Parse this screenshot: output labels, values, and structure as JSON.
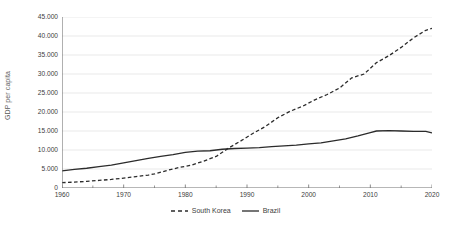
{
  "chart_data": {
    "type": "line",
    "title": "",
    "subtitle": "",
    "xlabel": "",
    "ylabel": "GDP per capita",
    "xlim": [
      1960,
      2020
    ],
    "ylim": [
      0,
      45000
    ],
    "grid": "horizontal",
    "legend_position": "bottom-center",
    "y_tick_labels": [
      "45.000",
      "40.000",
      "35.000",
      "30.000",
      "25.000",
      "20.000",
      "15.000",
      "10.000",
      "5.000",
      "0"
    ],
    "y_tick_values": [
      45000,
      40000,
      35000,
      30000,
      25000,
      20000,
      15000,
      10000,
      5000,
      0
    ],
    "x_tick_labels": [
      "1960",
      "1970",
      "1980",
      "1990",
      "2000",
      "2010",
      "2020"
    ],
    "x_tick_values": [
      1960,
      1970,
      1980,
      1990,
      2000,
      2010,
      2020
    ],
    "x_minor_tick_values": [
      1965,
      1975,
      1985,
      1995,
      2005,
      2015
    ],
    "series": [
      {
        "name": "South Korea",
        "style": "dashed",
        "color": "#2b2b2b",
        "x": [
          1960,
          1962,
          1964,
          1966,
          1968,
          1970,
          1972,
          1974,
          1975,
          1977,
          1979,
          1981,
          1983,
          1985,
          1987,
          1989,
          1991,
          1993,
          1995,
          1997,
          1999,
          2001,
          2003,
          2005,
          2007,
          2009,
          2011,
          2013,
          2015,
          2017,
          2019,
          2020
        ],
        "values": [
          1400,
          1550,
          1750,
          2000,
          2250,
          2600,
          3000,
          3400,
          3700,
          4600,
          5400,
          6000,
          7100,
          8300,
          10500,
          12400,
          14400,
          16200,
          18500,
          20200,
          21500,
          23200,
          24600,
          26300,
          29000,
          30000,
          33000,
          34800,
          37000,
          39500,
          41500,
          42000
        ],
        "start_value": 1400,
        "end_value": 42000
      },
      {
        "name": "Brazil",
        "style": "solid",
        "color": "#2b2b2b",
        "x": [
          1960,
          1962,
          1964,
          1966,
          1968,
          1970,
          1972,
          1974,
          1976,
          1978,
          1980,
          1982,
          1984,
          1986,
          1988,
          1990,
          1992,
          1994,
          1996,
          1998,
          2000,
          2002,
          2004,
          2006,
          2008,
          2010,
          2011,
          2013,
          2015,
          2017,
          2019,
          2020
        ],
        "values": [
          4500,
          4900,
          5200,
          5600,
          6000,
          6600,
          7200,
          7800,
          8300,
          8800,
          9400,
          9700,
          9800,
          10200,
          10400,
          10500,
          10600,
          10900,
          11100,
          11300,
          11600,
          11900,
          12400,
          12900,
          13700,
          14600,
          15000,
          15100,
          15000,
          14900,
          14900,
          14500
        ],
        "start_value": 4500,
        "end_value": 14500
      }
    ],
    "crossover": {
      "year": 1987,
      "value": 10500
    },
    "legend": [
      {
        "label": "South Korea",
        "style": "dashed"
      },
      {
        "label": "Brazil",
        "style": "solid"
      }
    ],
    "colors": {
      "line": "#2b2b2b",
      "grid": "#e9e9e9",
      "axis": "#7f7f7f",
      "tick_text": "#404040",
      "background": "#ffffff"
    }
  }
}
